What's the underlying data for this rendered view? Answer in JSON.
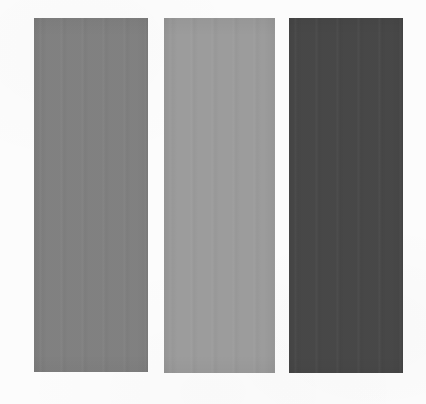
{
  "figure": {
    "background_color": "#fcfcfc",
    "canvas_width": 426,
    "canvas_height": 404
  },
  "chart_data": {
    "type": "bar",
    "xlabel": "",
    "ylabel": "",
    "categories": [
      "swatch-1",
      "swatch-2",
      "swatch-3"
    ],
    "values": [
      354,
      355,
      355
    ],
    "grid": false,
    "legend": null,
    "series": [
      {
        "name": "gray level",
        "values": [
          138,
          201,
          74
        ]
      }
    ],
    "annotations": [
      "medium gray panel",
      "light gray panel",
      "dark gray panel"
    ]
  },
  "swatches": [
    {
      "name": "swatch-medium-gray",
      "color": "#8a8a8a",
      "gray_level": 138,
      "x": 34,
      "y": 18,
      "width": 114,
      "height": 354,
      "tone": "medium"
    },
    {
      "name": "swatch-light-gray",
      "color": "#c9c9c9",
      "gray_level": 201,
      "x": 164,
      "y": 18,
      "width": 111,
      "height": 355,
      "tone": "light"
    },
    {
      "name": "swatch-dark-gray",
      "color": "#4a4a4a",
      "gray_level": 74,
      "x": 289,
      "y": 18,
      "width": 114,
      "height": 355,
      "tone": "dark"
    }
  ]
}
